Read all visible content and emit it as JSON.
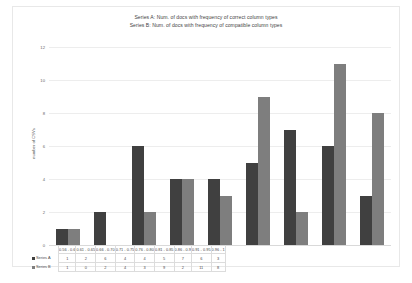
{
  "chart_data": {
    "type": "bar",
    "title": "Series A: Num. of docs with frequency of correct column types\nSeries B: Num. of docs with frequency of compatible column types",
    "title_lines": [
      "Series A: Num. of docs with frequency of correct column types",
      "Series B: Num. of docs with frequency of compatible column types"
    ],
    "xlabel": "",
    "ylabel": "number of CSVs",
    "ylim": [
      0,
      12
    ],
    "yticks": [
      12,
      10,
      8,
      6,
      4,
      2,
      0
    ],
    "grid": true,
    "legend_position": "data-table",
    "categories": [
      "0.56 - 0.6",
      "0.61 - 0.65",
      "0.66 - 0.70",
      "0.71 - 0.75",
      "0.76 - 0.80",
      "0.81 - 0.85",
      "0.86 - 0.9",
      "0.91 - 0.95",
      "0.96 - 1"
    ],
    "series": [
      {
        "name": "Series A",
        "color": "#404040",
        "values": [
          1,
          2,
          6,
          4,
          4,
          5,
          7,
          6,
          3
        ]
      },
      {
        "name": "Series B",
        "color": "#7e7e7e",
        "values": [
          1,
          0,
          2,
          4,
          3,
          9,
          2,
          11,
          8
        ]
      }
    ]
  }
}
